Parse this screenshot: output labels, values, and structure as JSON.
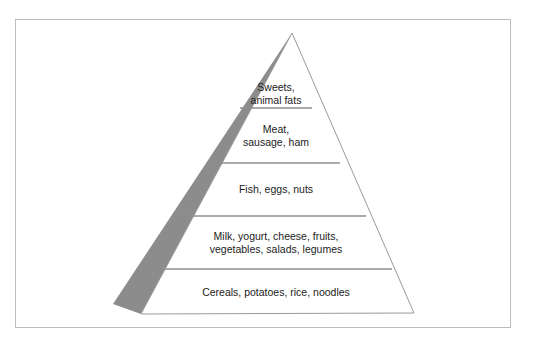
{
  "diagram": {
    "type": "food-pyramid",
    "levels": [
      {
        "label_line1": "Sweets,",
        "label_line2": "animal fats"
      },
      {
        "label_line1": "Meat,",
        "label_line2": "sausage, ham"
      },
      {
        "label_line1": "Fish, eggs, nuts",
        "label_line2": ""
      },
      {
        "label_line1": "Milk, yogurt, cheese, fruits,",
        "label_line2": "vegetables, salads, legumes"
      },
      {
        "label_line1": "Cereals, potatoes, rice, noodles",
        "label_line2": ""
      }
    ],
    "colors": {
      "shadow": "#8c8c8c",
      "outline": "#9a9a9a",
      "divider": "#8f8f8f",
      "frame": "#bdbdbd"
    }
  }
}
